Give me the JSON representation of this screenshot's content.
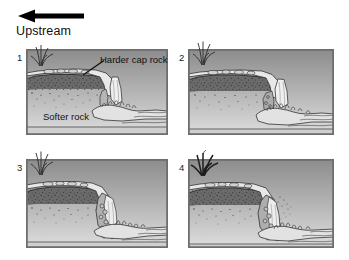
{
  "figure": {
    "background_color": "#ffffff"
  },
  "flow_legend": {
    "arrow_icon": "left-arrow-icon",
    "arrow_direction": "left",
    "label": "Upstream",
    "arrow_color": "#000000"
  },
  "panels": [
    {
      "number": "1",
      "position": "top-left",
      "frame_color": "#6e6e6e",
      "sky_color_top": "#8f8f8f",
      "sky_color_bottom": "#d8d8d8",
      "caprock_label": "Harder cap rock",
      "softrock_label": "Softer rock",
      "stage_description": "Initial waterfall with intact harder cap rock ledge overhanging plunge pool"
    },
    {
      "number": "2",
      "position": "top-right",
      "frame_color": "#6e6e6e",
      "sky_color_top": "#8f8f8f",
      "sky_color_bottom": "#d8d8d8",
      "caprock_label": "",
      "softrock_label": "",
      "stage_description": "Softer rock undercut further; overhang lengthens and plunge pool deepens"
    },
    {
      "number": "3",
      "position": "bottom-left",
      "frame_color": "#6e6e6e",
      "sky_color_top": "#8f8f8f",
      "sky_color_bottom": "#d8d8d8",
      "caprock_label": "",
      "softrock_label": "",
      "stage_description": "Cap rock collapses; waterfall retreats upstream leaving a steep face"
    },
    {
      "number": "4",
      "position": "bottom-right",
      "frame_color": "#6e6e6e",
      "sky_color_top": "#8f8f8f",
      "sky_color_bottom": "#d8d8d8",
      "caprock_label": "",
      "softrock_label": "",
      "stage_description": "Waterfall has retreated further upstream forming a gorge with rock debris"
    }
  ],
  "colors": {
    "ink": "#111111",
    "frame": "#6e6e6e",
    "rock_dark": "#565656",
    "rock_mid": "#8a8a8a",
    "water_light": "#ececec",
    "stipple": "#3a3a3a"
  }
}
